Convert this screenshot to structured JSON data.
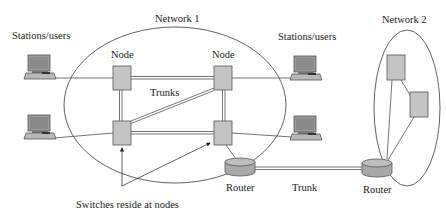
{
  "diagram": {
    "type": "network-topology",
    "colors": {
      "line": "#3a3a3a",
      "box_fill": "#c4c4c4",
      "box_stroke": "#555555",
      "text": "#1a1a1a",
      "background": "#ffffff"
    },
    "labels": {
      "network1": "Network 1",
      "network2": "Network 2",
      "stations_left": "Stations/users",
      "stations_right": "Stations/users",
      "node_top_left": "Node",
      "node_top_right": "Node",
      "trunks": "Trunks",
      "router1": "Router",
      "router2": "Router",
      "trunk": "Trunk",
      "switches_note": "Switches reside at nodes"
    },
    "network1": {
      "nodes": [
        "node-top-left",
        "node-top-right",
        "node-bottom-left",
        "node-bottom-right"
      ],
      "trunks": [
        [
          "node-top-left",
          "node-top-right"
        ],
        [
          "node-top-left",
          "node-bottom-left"
        ],
        [
          "node-top-right",
          "node-bottom-right"
        ],
        [
          "node-bottom-left",
          "node-bottom-right"
        ],
        [
          "node-bottom-left",
          "node-top-right"
        ]
      ],
      "stations": [
        {
          "id": "station-left-top",
          "connected_to": "node-top-left"
        },
        {
          "id": "station-left-bottom",
          "connected_to": "node-bottom-left"
        },
        {
          "id": "station-right-top",
          "connected_to": "node-top-right"
        },
        {
          "id": "station-right-bottom",
          "connected_to": "node-bottom-right"
        }
      ],
      "router": {
        "id": "router1",
        "connected_to": "node-bottom-right"
      }
    },
    "network2": {
      "nodes": [
        "n2-node-top",
        "n2-node-right"
      ],
      "links": [
        [
          "n2-node-top",
          "n2-node-right"
        ],
        [
          "n2-node-top",
          "router2"
        ],
        [
          "n2-node-right",
          "router2"
        ]
      ],
      "router": {
        "id": "router2"
      }
    },
    "inter_network_link": {
      "from": "router1",
      "to": "router2",
      "label": "Trunk"
    }
  }
}
